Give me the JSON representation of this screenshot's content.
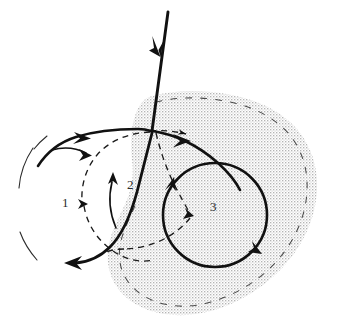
{
  "figure": {
    "kind": "diagram",
    "canvas": {
      "width": 338,
      "height": 331
    },
    "background_color": "#ffffff",
    "ink_color": "#111111",
    "stipple_color": "#c9c9c9",
    "label_color": "#2b2b2b"
  },
  "labels": [
    {
      "name": "region-1",
      "text": "1",
      "x": 62,
      "y": 196
    },
    {
      "name": "region-2",
      "text": "2",
      "x": 127,
      "y": 178
    },
    {
      "name": "region-3",
      "text": "3",
      "x": 210,
      "y": 200
    }
  ],
  "elements": {
    "incoming_arrow": {
      "name": "incoming-trajectory-arrow",
      "style": "solid-bold",
      "from": {
        "x": 168,
        "y": 12
      },
      "to": {
        "x": 152,
        "y": 131
      },
      "arrowhead_at": {
        "x": 158,
        "y": 52
      },
      "arrowhead_direction": "down"
    },
    "convergence_point": {
      "x": 152,
      "y": 131
    },
    "outgoing_upper_left": {
      "name": "upper-left-outgoing-curve",
      "style": "solid-bold",
      "arrowhead_at": {
        "x": 86,
        "y": 138
      },
      "arrowhead_direction": "right"
    },
    "outgoing_lower_left": {
      "name": "lower-left-outgoing-arrow",
      "style": "solid-bold",
      "arrowhead_at": {
        "x": 66,
        "y": 263
      },
      "arrowhead_direction": "left"
    },
    "outgoing_right": {
      "name": "right-outgoing-curve",
      "style": "solid-bold",
      "arrowhead_at": {
        "x": 186,
        "y": 141
      },
      "arrowhead_direction": "right"
    },
    "short_thin_arrow_region1": {
      "name": "region-1-short-arrow",
      "style": "solid-thin",
      "arrowhead_at": {
        "x": 90,
        "y": 155
      },
      "arrowhead_direction": "right"
    },
    "thin_arc_region2": {
      "name": "region-2-inner-arc-arrow",
      "style": "solid-thin",
      "arrowhead_at": {
        "x": 113,
        "y": 175
      },
      "arrowhead_direction": "up"
    },
    "circle_3": {
      "name": "region-3-orbit-circle",
      "style": "solid-bold-closed-circle",
      "center": {
        "x": 215,
        "y": 215
      },
      "radius": 52,
      "arrowheads": [
        {
          "x": 171,
          "y": 185,
          "direction": "up-right"
        },
        {
          "x": 257,
          "y": 250,
          "direction": "down-right"
        }
      ]
    },
    "dashed_lens_region1": {
      "name": "region-1-dashed-trajectory",
      "style": "dashed-thin",
      "arrowhead_at": {
        "x": 84,
        "y": 204
      },
      "arrowhead_direction": "right"
    },
    "dashed_through_circle3": {
      "name": "region-3-dashed-trajectory",
      "style": "dashed-thin",
      "arrowheads": [
        {
          "x": 190,
          "y": 215,
          "direction": "right-down"
        },
        {
          "x": 190,
          "y": 135,
          "direction": "right"
        }
      ]
    },
    "dashed_left_boundary_arc": {
      "name": "region-1-dashed-boundary-arc",
      "style": "dashed-thin-open-arc"
    },
    "shaded_region": {
      "name": "stippled-outer-region",
      "fill": "stipple",
      "boundary_style": "dashed-thin",
      "extent": {
        "left": 108,
        "top": 92,
        "right": 318,
        "bottom": 318
      }
    }
  }
}
